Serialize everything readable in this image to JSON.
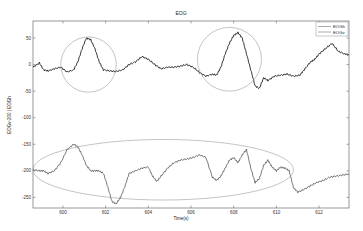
{
  "chart_data": {
    "type": "line",
    "title": "EOG",
    "xlabel": "Time(s)",
    "ylabel": "EOGv-200 | EOGh",
    "xlim": [
      598.6,
      613.4
    ],
    "ylim": [
      -270,
      82
    ],
    "xticks": [
      600,
      602,
      604,
      606,
      608,
      610,
      612
    ],
    "yticks": [
      50,
      0,
      -50,
      -100,
      -150,
      -200,
      -250
    ],
    "grid": false,
    "legend": {
      "position": "upper right",
      "entries": [
        "EOGh",
        "EOGv"
      ]
    },
    "series": [
      {
        "name": "EOGh",
        "color": "#222222",
        "x": [
          598.6,
          598.9,
          599.1,
          599.3,
          599.6,
          599.9,
          600.2,
          600.5,
          600.7,
          600.9,
          601.1,
          601.3,
          601.5,
          601.7,
          601.9,
          602.2,
          602.5,
          602.8,
          603.1,
          603.4,
          603.7,
          604.0,
          604.3,
          604.6,
          604.9,
          605.2,
          605.5,
          605.8,
          606.1,
          606.4,
          606.7,
          607.0,
          607.2,
          607.4,
          607.6,
          607.8,
          608.0,
          608.2,
          608.4,
          608.6,
          608.8,
          609.0,
          609.2,
          609.4,
          609.6,
          609.9,
          610.2,
          610.5,
          610.8,
          611.1,
          611.3,
          611.6,
          611.8,
          612.0,
          612.3,
          612.6,
          612.9,
          613.2,
          613.4
        ],
        "y": [
          -5,
          3,
          -10,
          -12,
          -8,
          -5,
          -14,
          -10,
          5,
          30,
          50,
          47,
          30,
          5,
          -10,
          -12,
          -13,
          -10,
          0,
          5,
          15,
          10,
          0,
          -8,
          -5,
          -5,
          -3,
          0,
          -5,
          -15,
          -22,
          -18,
          -20,
          -5,
          20,
          40,
          55,
          60,
          50,
          20,
          -10,
          -40,
          -45,
          -25,
          -30,
          -22,
          -20,
          -18,
          -22,
          -20,
          -10,
          5,
          10,
          20,
          30,
          40,
          25,
          20,
          18
        ]
      },
      {
        "name": "EOGv",
        "color": "#222222",
        "x": [
          598.6,
          598.9,
          599.1,
          599.3,
          599.6,
          599.9,
          600.2,
          600.5,
          600.7,
          600.9,
          601.1,
          601.3,
          601.5,
          601.7,
          601.9,
          602.1,
          602.3,
          602.5,
          602.7,
          602.9,
          603.1,
          603.4,
          603.7,
          604.0,
          604.2,
          604.4,
          604.6,
          604.9,
          605.2,
          605.5,
          605.8,
          606.1,
          606.4,
          606.7,
          607.0,
          607.2,
          607.4,
          607.6,
          607.8,
          608.0,
          608.2,
          608.4,
          608.6,
          608.8,
          609.0,
          609.2,
          609.4,
          609.6,
          609.8,
          610.0,
          610.2,
          610.4,
          610.6,
          610.8,
          611.0,
          611.3,
          611.6,
          611.9,
          612.2,
          612.5,
          612.8,
          613.1,
          613.4
        ],
        "y": [
          -198,
          -200,
          -200,
          -205,
          -200,
          -185,
          -160,
          -150,
          -155,
          -170,
          -190,
          -200,
          -200,
          -200,
          -205,
          -230,
          -258,
          -262,
          -250,
          -230,
          -205,
          -200,
          -195,
          -193,
          -210,
          -220,
          -210,
          -195,
          -185,
          -180,
          -178,
          -175,
          -170,
          -175,
          -212,
          -218,
          -210,
          -195,
          -180,
          -175,
          -185,
          -170,
          -160,
          -195,
          -222,
          -215,
          -190,
          -180,
          -193,
          -200,
          -193,
          -195,
          -200,
          -232,
          -240,
          -235,
          -228,
          -222,
          -218,
          -212,
          -210,
          -208,
          -206
        ]
      }
    ],
    "annotations": [
      {
        "type": "ellipse",
        "target": "EOGh",
        "cx": 601.2,
        "cy": 0,
        "rx": 1.3,
        "ry": 52
      },
      {
        "type": "ellipse",
        "target": "EOGh",
        "cx": 607.8,
        "cy": 10,
        "rx": 1.5,
        "ry": 60
      },
      {
        "type": "ellipse",
        "target": "EOGv",
        "cx": 604.7,
        "cy": -198,
        "rx": 6.1,
        "ry": 57
      }
    ]
  }
}
